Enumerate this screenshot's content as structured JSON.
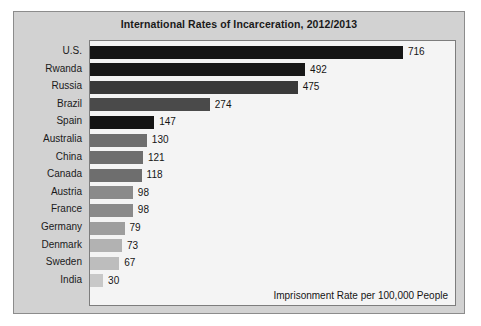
{
  "chart_data": {
    "type": "bar",
    "orientation": "horizontal",
    "title": "International Rates of Incarceration, 2012/2013",
    "xlabel": "",
    "ylabel": "",
    "annotation": "Imprisonment Rate per 100,000 People",
    "grid": false,
    "legend": "none",
    "xlim": [
      0,
      760
    ],
    "categories": [
      "U.S.",
      "Rwanda",
      "Russia",
      "Brazil",
      "Spain",
      "Australia",
      "China",
      "Canada",
      "Austria",
      "France",
      "Germany",
      "Denmark",
      "Sweden",
      "India"
    ],
    "values": [
      716,
      492,
      475,
      274,
      147,
      130,
      121,
      118,
      98,
      98,
      79,
      73,
      67,
      30
    ],
    "bar_colors": [
      "#151515",
      "#181818",
      "#3a3a3a",
      "#4a4a4a",
      "#141414",
      "#6e6e6e",
      "#6e6e6e",
      "#6e6e6e",
      "#8a8a8a",
      "#8a8a8a",
      "#9e9e9e",
      "#b2b2b2",
      "#bdbdbd",
      "#c8c8c8"
    ],
    "value_labels": [
      "716",
      "492",
      "475",
      "274",
      "147",
      "130",
      "121",
      "118",
      "98",
      "98",
      "79",
      "73",
      "67",
      "30"
    ]
  },
  "figure": {
    "panel_color": "#d2d2d2",
    "plot_color": "#f4f4f4",
    "border_color": "#8c8c8c"
  }
}
